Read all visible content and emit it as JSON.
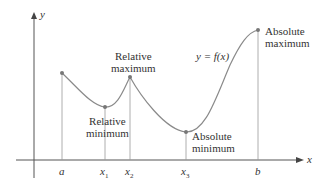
{
  "diagram": {
    "axes": {
      "x_label": "x",
      "y_label": "y"
    },
    "curve_label": "y = f(x)",
    "tick_labels": {
      "a": "a",
      "x1": "x",
      "x1_sub": "1",
      "x2": "x",
      "x2_sub": "2",
      "x3": "x",
      "x3_sub": "3",
      "b": "b"
    },
    "annotations": {
      "rel_max_line1": "Relative",
      "rel_max_line2": "maximum",
      "rel_min_line1": "Relative",
      "rel_min_line2": "minimum",
      "abs_min_line1": "Absolute",
      "abs_min_line2": "minimum",
      "abs_max_line1": "Absolute",
      "abs_max_line2": "maximum"
    },
    "points": [
      {
        "name": "a",
        "x": 62,
        "y": 73
      },
      {
        "name": "x1",
        "x": 105,
        "y": 107,
        "type": "relative minimum"
      },
      {
        "name": "x2",
        "x": 130,
        "y": 77,
        "type": "relative maximum"
      },
      {
        "name": "x3",
        "x": 186,
        "y": 132,
        "type": "absolute minimum"
      },
      {
        "name": "b",
        "x": 258,
        "y": 30,
        "type": "absolute maximum"
      }
    ],
    "colors": {
      "axis": "#444444",
      "curve": "#8a8a8a",
      "point": "#777777",
      "text": "#333333"
    }
  }
}
